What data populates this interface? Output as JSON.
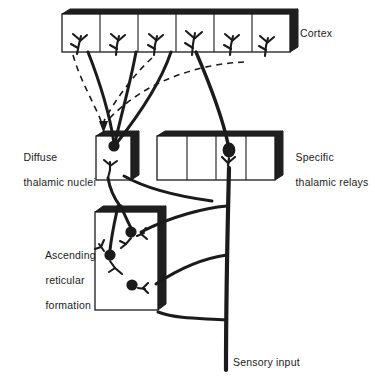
{
  "figure": {
    "ink_color": "#1b1b1b",
    "background_color": "#ffffff"
  },
  "labels": {
    "cortex": "Cortex",
    "diffuse_line1": "Diffuse",
    "diffuse_line2": "thalamic nuclei",
    "specific_line1": "Specific",
    "specific_line2": "thalamic relays",
    "reticular_line1": "Ascending",
    "reticular_line2": "reticular",
    "reticular_line3": "formation",
    "sensory": "Sensory input"
  },
  "structures": [
    {
      "name": "cortex",
      "label": "Cortex",
      "shape": "3d-box",
      "compartments": 6,
      "x": 62,
      "y": 14,
      "width": 228,
      "height": 38,
      "contents": "six columnar compartments each containing a branching apical dendrite"
    },
    {
      "name": "diffuse-thalamic-nuclei",
      "label": "Diffuse thalamic nuclei",
      "shape": "3d-box",
      "compartments": 1,
      "x": 96,
      "y": 136,
      "width": 35,
      "height": 44,
      "contents": "one neuron with filled soma and branching dendrite"
    },
    {
      "name": "specific-thalamic-relays",
      "label": "Specific thalamic relays",
      "shape": "3d-box",
      "compartments": 4,
      "x": 157,
      "y": 136,
      "width": 118,
      "height": 44,
      "contents": "four compartments, relay neuron with filled soma in third compartment"
    },
    {
      "name": "ascending-reticular-formation",
      "label": "Ascending reticular formation",
      "shape": "3d-box",
      "compartments": 1,
      "x": 95,
      "y": 212,
      "width": 63,
      "height": 98,
      "contents": "three neurons with filled somata and short dendrites"
    }
  ],
  "pathways": [
    {
      "name": "sensory-input-trunk",
      "style": "solid-thick",
      "description": "Thick vertical afferent trunk rising from Sensory input at the bottom to the specific thalamic relay neuron"
    },
    {
      "name": "specific-relay-to-cortex",
      "style": "solid-thick",
      "description": "Axon from specific thalamic relay neuron ascending to a cortical column"
    },
    {
      "name": "collaterals-to-reticular-formation",
      "style": "solid-thick",
      "description": "Three collateral branches leaving the sensory trunk and curving left into the ascending reticular formation"
    },
    {
      "name": "reticular-to-diffuse-thalamic",
      "style": "solid-thick",
      "description": "Axons from reticular formation neurons ascending to the diffuse thalamic nuclei"
    },
    {
      "name": "diffuse-thalamic-to-cortex",
      "style": "solid-thick",
      "description": "Axons from the diffuse thalamic nuclei ascending and fanning out to several cortical columns"
    },
    {
      "name": "corticofugal-feedback",
      "style": "dashed-arrow",
      "description": "Dashed descending corticofugal fibres from cortex converging on the diffuse thalamic nuclei, ending in an arrowhead"
    }
  ]
}
